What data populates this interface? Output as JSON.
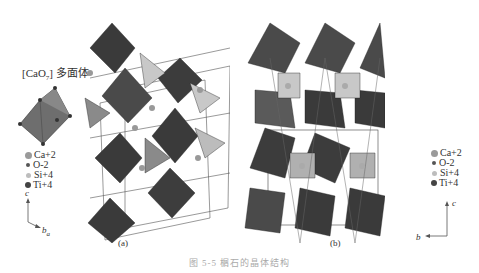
{
  "figure": {
    "caption": "图 5-5  榍石的晶体结构",
    "polyhedron_label": {
      "prefix": "[CaO",
      "sub": "7",
      "suffix": "] 多面体"
    },
    "legend": [
      {
        "label": "Ca+2",
        "color": "#9a9a9a",
        "size": 7
      },
      {
        "label": "O-2",
        "color": "#555555",
        "size": 4
      },
      {
        "label": "Si+4",
        "color": "#bdbdbd",
        "size": 5
      },
      {
        "label": "Ti+4",
        "color": "#444444",
        "size": 6
      }
    ],
    "panel_a": {
      "label": "(a)",
      "axes": {
        "vertical": "c",
        "horizontal": "b",
        "depth": "a"
      }
    },
    "panel_b": {
      "label": "(b)",
      "axes": {
        "vertical": "c",
        "horizontal": "b"
      }
    },
    "colors": {
      "ti_octahedron_dark": "#3a3a3a",
      "ti_octahedron_mid": "#5a5a5a",
      "ca_polyhedron": "#777777",
      "si_tetrahedron": "#c8c8c8"
    }
  }
}
